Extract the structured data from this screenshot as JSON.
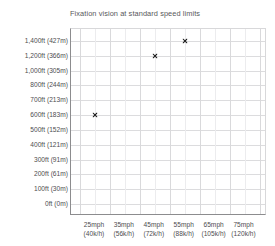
{
  "chart_data": {
    "type": "scatter",
    "title": "Fixation vision at standard speed limits",
    "xlabel": "",
    "ylabel": "",
    "grid": true,
    "legend": "none",
    "marker_symbol": "x",
    "marker_color": "#1c1c1c",
    "x_categories": [
      {
        "primary": "25mph",
        "secondary": "(40k/h)",
        "mph": 25,
        "kmh": 40
      },
      {
        "primary": "35mph",
        "secondary": "(56k/h)",
        "mph": 35,
        "kmh": 56
      },
      {
        "primary": "45mph",
        "secondary": "(72k/h)",
        "mph": 45,
        "kmh": 72
      },
      {
        "primary": "55mph",
        "secondary": "(88k/h)",
        "mph": 55,
        "kmh": 88
      },
      {
        "primary": "65mph",
        "secondary": "(105k/h)",
        "mph": 65,
        "kmh": 105
      },
      {
        "primary": "75mph",
        "secondary": "(120k/h)",
        "mph": 75,
        "kmh": 120
      }
    ],
    "y_ticks": [
      {
        "label": "1,400ft (427m)",
        "ft": 1400,
        "m": 427
      },
      {
        "label": "1,200ft (366m)",
        "ft": 1200,
        "m": 366
      },
      {
        "label": "1,000ft (305m)",
        "ft": 1000,
        "m": 305
      },
      {
        "label": "800ft (244m)",
        "ft": 800,
        "m": 244
      },
      {
        "label": "700ft (213m)",
        "ft": 700,
        "m": 213
      },
      {
        "label": "600ft (183m)",
        "ft": 600,
        "m": 183
      },
      {
        "label": "500ft (152m)",
        "ft": 500,
        "m": 152
      },
      {
        "label": "400ft (121m)",
        "ft": 400,
        "m": 121
      },
      {
        "label": "300ft (91m)",
        "ft": 300,
        "m": 91
      },
      {
        "label": "200ft (61m)",
        "ft": 200,
        "m": 61
      },
      {
        "label": "100ft (30m)",
        "ft": 100,
        "m": 30
      },
      {
        "label": "0ft (0m)",
        "ft": 0,
        "m": 0
      }
    ],
    "points": [
      {
        "x_label": "25mph",
        "mph": 25,
        "kmh": 40,
        "y_label": "600ft (183m)",
        "ft": 600,
        "m": 183
      },
      {
        "x_label": "45mph",
        "mph": 45,
        "kmh": 72,
        "y_label": "1,200ft (366m)",
        "ft": 1200,
        "m": 366
      },
      {
        "x_label": "55mph",
        "mph": 55,
        "kmh": 88,
        "y_label": "1,400ft (427m)",
        "ft": 1400,
        "m": 427
      }
    ]
  },
  "colors": {
    "background": "#ffffff",
    "axis": "#8c8c8e",
    "gridline_major": "#d9d9db",
    "gridline_minor": "#ececee",
    "text": "#4d4d4f",
    "title_text": "#58585a",
    "marker": "#1c1c1c"
  }
}
